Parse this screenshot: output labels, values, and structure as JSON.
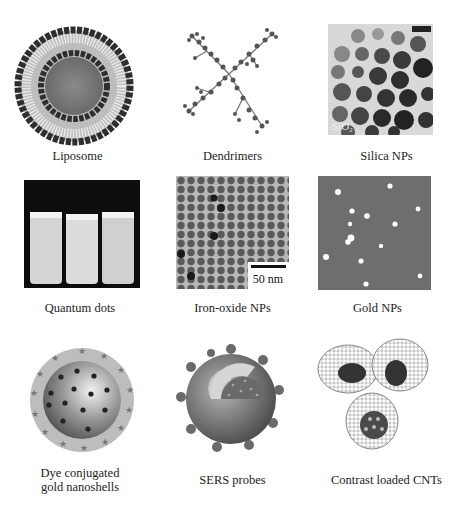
{
  "figure": {
    "panels": [
      {
        "id": "liposome",
        "caption": "Liposome"
      },
      {
        "id": "dendrimers",
        "caption": "Dendrimers"
      },
      {
        "id": "silica",
        "caption": "Silica NPs",
        "inset_label": "SiO₂"
      },
      {
        "id": "quantum-dots",
        "caption": "Quantum dots"
      },
      {
        "id": "iron-oxide",
        "caption": "Iron-oxide NPs",
        "scale_bar": "50 nm"
      },
      {
        "id": "gold",
        "caption": "Gold NPs"
      },
      {
        "id": "dye-nanoshells",
        "caption_line1": "Dye conjugated",
        "caption_line2": "gold nanoshells"
      },
      {
        "id": "sers",
        "caption": "SERS probes"
      },
      {
        "id": "cnt",
        "caption": "Contrast loaded CNTs"
      }
    ]
  },
  "colors": {
    "background": "#ffffff",
    "dark": "#2a2a2a",
    "mid_gray": "#777777",
    "light_gray": "#cfcfcf",
    "gold_bg": "#6e6e6e"
  }
}
